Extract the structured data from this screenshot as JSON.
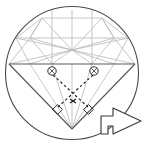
{
  "figure": {
    "type": "geometry-diagram",
    "canvas": {
      "width": 144,
      "height": 146
    },
    "colors": {
      "outline": "#4a4a4a",
      "facet_line": "#b9b9b9",
      "ray_dashed": "#1a1a1a",
      "arrow_outline": "#3a3a3a",
      "background": "#ffffff"
    }
  },
  "circle": {
    "label": "bounding-circle",
    "cx": 72,
    "cy": 73,
    "r": 67
  },
  "gem": {
    "girdle": {
      "label": "girdle-line",
      "y": 64,
      "x_left": 9,
      "x_right": 135
    },
    "culet": {
      "label": "culet-apex",
      "x": 72,
      "y": 129
    },
    "crown_center": {
      "label": "crown-hub",
      "x": 72,
      "y": 50
    },
    "table_top_y": 18
  },
  "markers": {
    "point_left": {
      "label": "reflection-point-left",
      "x": 52,
      "y": 72,
      "r": 4
    },
    "point_right": {
      "label": "reflection-point-right",
      "x": 94,
      "y": 72,
      "r": 4
    },
    "cross_point": {
      "label": "ray-crossing-point",
      "x": 73,
      "y": 101
    },
    "right_angle_left": {
      "label": "right-angle-left",
      "x": 57,
      "y": 110
    },
    "right_angle_right": {
      "label": "right-angle-right",
      "x": 89,
      "y": 110
    }
  },
  "rays": [
    {
      "label": "ray-left-down",
      "from": [
        52,
        74
      ],
      "to": [
        89,
        108
      ]
    },
    {
      "label": "ray-right-down",
      "from": [
        94,
        74
      ],
      "to": [
        57,
        108
      ]
    }
  ],
  "arrow": {
    "label": "direction-arrow",
    "direction": "right",
    "x": 100,
    "y": 103,
    "width": 42,
    "height": 36
  },
  "labels": {
    "caption": ""
  }
}
